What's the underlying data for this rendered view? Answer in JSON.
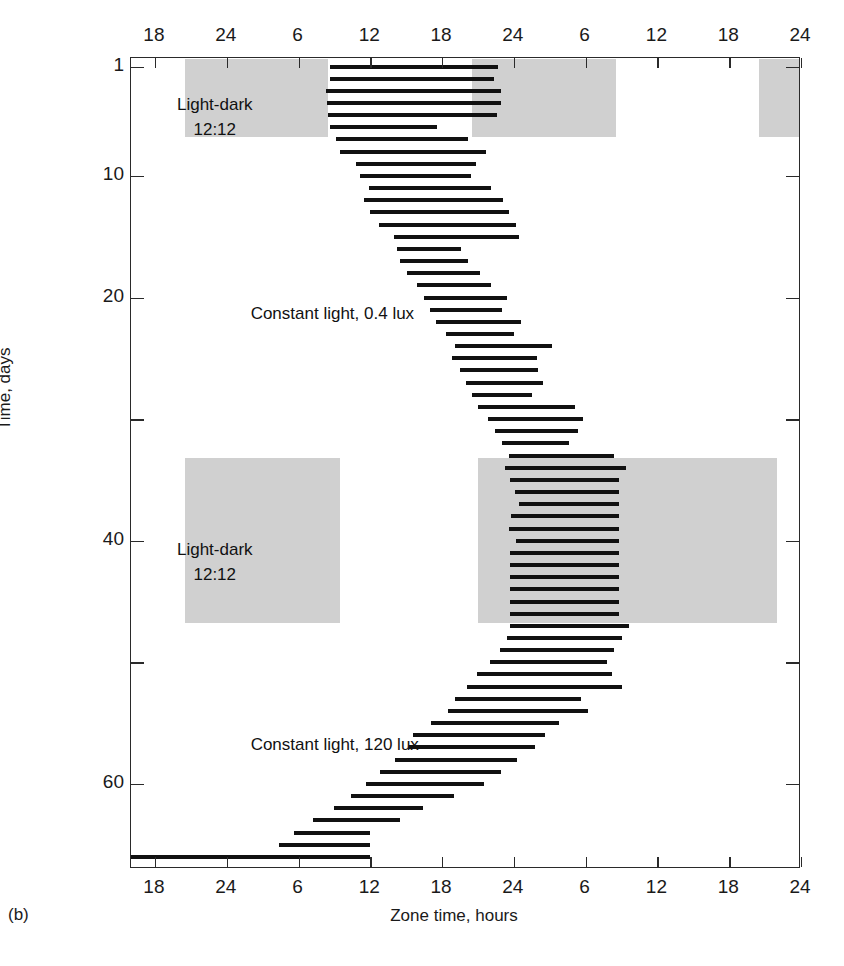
{
  "panel_label": "(b)",
  "axes": {
    "x_title": "Zone time, hours",
    "y_title": "Time, days",
    "x_ticks": [
      "18",
      "24",
      "6",
      "12",
      "18",
      "24",
      "6",
      "12",
      "18",
      "24"
    ],
    "x_tick_hours": [
      18,
      24,
      30,
      36,
      42,
      48,
      54,
      60,
      66,
      72
    ],
    "x_range_hours": [
      16,
      72
    ],
    "y_ticks_labeled": [
      1,
      10,
      20,
      40,
      60
    ],
    "y_ticks_all": [
      1,
      10,
      20,
      30,
      40,
      50,
      60
    ],
    "y_range_days": [
      0.3,
      67.0
    ]
  },
  "annotations": [
    {
      "id": "ld-top",
      "lines": [
        "Light-dark",
        "12:12"
      ],
      "x_hour": 23.0,
      "y_day": 3.2
    },
    {
      "id": "ll-04",
      "lines": [
        "Constant light, 0.4 lux"
      ],
      "x_hour": 26.0,
      "y_day": 20.5
    },
    {
      "id": "ld-bottom",
      "lines": [
        "Light-dark",
        "12:12"
      ],
      "x_hour": 23.0,
      "y_day": 39.8
    },
    {
      "id": "ll-120",
      "lines": [
        "Constant light, 120 lux"
      ],
      "x_hour": 26.0,
      "y_day": 56.0
    }
  ],
  "colors": {
    "dark_shade": "#d0d0d0",
    "activity_bar": "#111111",
    "frame": "#2a2a2a",
    "background": "#ffffff"
  },
  "chart_data": {
    "type": "actogram",
    "xlabel": "Zone time, hours",
    "ylabel": "Time, days",
    "xlim": [
      16,
      72
    ],
    "ylim": [
      0.3,
      67.0
    ],
    "grid": false,
    "legend": "none",
    "bar_height_px": 4,
    "dark_shade_blocks": [
      {
        "phase": "Light-dark 12:12",
        "x_start_hour": 20.5,
        "x_end_hour": 32.5,
        "day_start": 0.4,
        "day_end": 6.8
      },
      {
        "phase": "Light-dark 12:12",
        "x_start_hour": 44.5,
        "x_end_hour": 56.5,
        "day_start": 0.4,
        "day_end": 6.8
      },
      {
        "phase": "Light-dark 12:12",
        "x_start_hour": 68.5,
        "x_end_hour": 72.0,
        "day_start": 0.4,
        "day_end": 6.8
      },
      {
        "phase": "Light-dark 12:12",
        "x_start_hour": 20.5,
        "x_end_hour": 33.5,
        "day_start": 33.2,
        "day_end": 46.8
      },
      {
        "phase": "Light-dark 12:12",
        "x_start_hour": 45.0,
        "x_end_hour": 70.0,
        "day_start": 33.2,
        "day_end": 46.8
      }
    ],
    "phase_segments": [
      {
        "label": "Light-dark 12:12",
        "day_start": 1,
        "day_end": 6
      },
      {
        "label": "Constant light, 0.4 lux",
        "day_start": 7,
        "day_end": 33
      },
      {
        "label": "Light-dark 12:12",
        "day_start": 34,
        "day_end": 47
      },
      {
        "label": "Constant light, 120 lux",
        "day_start": 48,
        "day_end": 66
      }
    ],
    "activity_bars": [
      {
        "day": 1,
        "start_hour": 32.6,
        "end_hour": 46.7
      },
      {
        "day": 2,
        "start_hour": 32.6,
        "end_hour": 46.3
      },
      {
        "day": 3,
        "start_hour": 32.3,
        "end_hour": 46.9
      },
      {
        "day": 4,
        "start_hour": 32.4,
        "end_hour": 46.9
      },
      {
        "day": 5,
        "start_hour": 32.5,
        "end_hour": 46.6
      },
      {
        "day": 6,
        "start_hour": 32.6,
        "end_hour": 41.6
      },
      {
        "day": 7,
        "start_hour": 33.1,
        "end_hour": 44.2
      },
      {
        "day": 8,
        "start_hour": 33.5,
        "end_hour": 45.7
      },
      {
        "day": 9,
        "start_hour": 34.8,
        "end_hour": 44.8
      },
      {
        "day": 10,
        "start_hour": 35.1,
        "end_hour": 44.4
      },
      {
        "day": 11,
        "start_hour": 35.9,
        "end_hour": 46.1
      },
      {
        "day": 12,
        "start_hour": 35.5,
        "end_hour": 47.1
      },
      {
        "day": 13,
        "start_hour": 36.0,
        "end_hour": 47.6
      },
      {
        "day": 14,
        "start_hour": 36.7,
        "end_hour": 48.2
      },
      {
        "day": 15,
        "start_hour": 38.0,
        "end_hour": 48.4
      },
      {
        "day": 16,
        "start_hour": 38.2,
        "end_hour": 43.6
      },
      {
        "day": 17,
        "start_hour": 38.5,
        "end_hour": 44.2
      },
      {
        "day": 18,
        "start_hour": 39.1,
        "end_hour": 45.2
      },
      {
        "day": 19,
        "start_hour": 39.9,
        "end_hour": 46.1
      },
      {
        "day": 20,
        "start_hour": 40.5,
        "end_hour": 47.4
      },
      {
        "day": 21,
        "start_hour": 41.0,
        "end_hour": 47.0
      },
      {
        "day": 22,
        "start_hour": 41.5,
        "end_hour": 48.6
      },
      {
        "day": 23,
        "start_hour": 42.3,
        "end_hour": 48.0
      },
      {
        "day": 24,
        "start_hour": 43.1,
        "end_hour": 51.2
      },
      {
        "day": 25,
        "start_hour": 42.8,
        "end_hour": 49.9
      },
      {
        "day": 26,
        "start_hour": 43.5,
        "end_hour": 50.0
      },
      {
        "day": 27,
        "start_hour": 44.0,
        "end_hour": 50.4
      },
      {
        "day": 28,
        "start_hour": 44.5,
        "end_hour": 49.5
      },
      {
        "day": 29,
        "start_hour": 45.0,
        "end_hour": 53.1
      },
      {
        "day": 30,
        "start_hour": 45.8,
        "end_hour": 53.8
      },
      {
        "day": 31,
        "start_hour": 46.4,
        "end_hour": 53.4
      },
      {
        "day": 32,
        "start_hour": 47.0,
        "end_hour": 52.6
      },
      {
        "day": 33,
        "start_hour": 47.6,
        "end_hour": 56.4
      },
      {
        "day": 34,
        "start_hour": 47.3,
        "end_hour": 57.4
      },
      {
        "day": 35,
        "start_hour": 47.7,
        "end_hour": 56.8
      },
      {
        "day": 36,
        "start_hour": 48.1,
        "end_hour": 56.8
      },
      {
        "day": 37,
        "start_hour": 48.4,
        "end_hour": 56.8
      },
      {
        "day": 38,
        "start_hour": 47.8,
        "end_hour": 56.8
      },
      {
        "day": 39,
        "start_hour": 47.6,
        "end_hour": 56.8
      },
      {
        "day": 40,
        "start_hour": 48.2,
        "end_hour": 56.8
      },
      {
        "day": 41,
        "start_hour": 47.7,
        "end_hour": 56.8
      },
      {
        "day": 42,
        "start_hour": 47.7,
        "end_hour": 56.8
      },
      {
        "day": 43,
        "start_hour": 47.7,
        "end_hour": 56.8
      },
      {
        "day": 44,
        "start_hour": 47.7,
        "end_hour": 56.8
      },
      {
        "day": 45,
        "start_hour": 47.7,
        "end_hour": 56.8
      },
      {
        "day": 46,
        "start_hour": 47.7,
        "end_hour": 56.8
      },
      {
        "day": 47,
        "start_hour": 47.7,
        "end_hour": 57.6
      },
      {
        "day": 48,
        "start_hour": 47.4,
        "end_hour": 57.0
      },
      {
        "day": 49,
        "start_hour": 46.8,
        "end_hour": 56.4
      },
      {
        "day": 50,
        "start_hour": 46.0,
        "end_hour": 55.8
      },
      {
        "day": 51,
        "start_hour": 44.9,
        "end_hour": 56.2
      },
      {
        "day": 52,
        "start_hour": 44.1,
        "end_hour": 57.0
      },
      {
        "day": 53,
        "start_hour": 43.1,
        "end_hour": 53.6
      },
      {
        "day": 54,
        "start_hour": 42.5,
        "end_hour": 54.2
      },
      {
        "day": 55,
        "start_hour": 41.1,
        "end_hour": 51.8
      },
      {
        "day": 56,
        "start_hour": 39.6,
        "end_hour": 50.6
      },
      {
        "day": 57,
        "start_hour": 39.2,
        "end_hour": 49.8
      },
      {
        "day": 58,
        "start_hour": 38.1,
        "end_hour": 48.3
      },
      {
        "day": 59,
        "start_hour": 36.8,
        "end_hour": 46.9
      },
      {
        "day": 60,
        "start_hour": 35.6,
        "end_hour": 45.5
      },
      {
        "day": 61,
        "start_hour": 34.4,
        "end_hour": 43.0
      },
      {
        "day": 62,
        "start_hour": 33.0,
        "end_hour": 40.4
      },
      {
        "day": 63,
        "start_hour": 31.2,
        "end_hour": 38.5
      },
      {
        "day": 64,
        "start_hour": 29.6,
        "end_hour": 36.0
      },
      {
        "day": 65,
        "start_hour": 28.4,
        "end_hour": 36.0
      },
      {
        "day": 66,
        "start_hour": 16.0,
        "end_hour": 36.0
      }
    ]
  }
}
